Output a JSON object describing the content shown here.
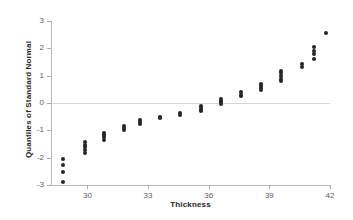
{
  "title": "",
  "chart_data": {
    "type": "scatter",
    "title": "",
    "xlabel": "Thickness",
    "ylabel": "Quantiles of Standard Normal",
    "xlim": [
      28.2,
      42.0
    ],
    "ylim": [
      -3,
      3
    ],
    "xticks": [
      30,
      33,
      36,
      39,
      42
    ],
    "yticks": [
      3,
      2,
      1,
      0,
      -1,
      -2,
      -3
    ],
    "grid": false,
    "legend": null,
    "reference_line": {
      "orientation": "horizontal",
      "y": 0,
      "color": "#d5d5da"
    },
    "marker": {
      "shape": "circle",
      "color": "#262626",
      "size": 4
    },
    "points": [
      {
        "x": 28.8,
        "y": -2.9
      },
      {
        "x": 28.8,
        "y": -2.52
      },
      {
        "x": 28.8,
        "y": -2.27
      },
      {
        "x": 28.8,
        "y": -2.05
      },
      {
        "x": 29.9,
        "y": -1.82
      },
      {
        "x": 29.9,
        "y": -1.72
      },
      {
        "x": 29.9,
        "y": -1.62
      },
      {
        "x": 29.9,
        "y": -1.52
      },
      {
        "x": 29.9,
        "y": -1.42
      },
      {
        "x": 30.8,
        "y": -1.34
      },
      {
        "x": 30.8,
        "y": -1.25
      },
      {
        "x": 30.8,
        "y": -1.16
      },
      {
        "x": 30.8,
        "y": -1.08
      },
      {
        "x": 31.8,
        "y": -1.0
      },
      {
        "x": 31.8,
        "y": -0.92
      },
      {
        "x": 31.8,
        "y": -0.84
      },
      {
        "x": 32.6,
        "y": -0.77
      },
      {
        "x": 32.6,
        "y": -0.7
      },
      {
        "x": 32.6,
        "y": -0.63
      },
      {
        "x": 33.6,
        "y": -0.56
      },
      {
        "x": 33.6,
        "y": -0.5
      },
      {
        "x": 34.6,
        "y": -0.43
      },
      {
        "x": 34.6,
        "y": -0.37
      },
      {
        "x": 35.6,
        "y": -0.3
      },
      {
        "x": 35.6,
        "y": -0.24
      },
      {
        "x": 35.6,
        "y": -0.17
      },
      {
        "x": 35.6,
        "y": -0.11
      },
      {
        "x": 36.6,
        "y": -0.05
      },
      {
        "x": 36.6,
        "y": 0.02
      },
      {
        "x": 36.6,
        "y": 0.09
      },
      {
        "x": 36.6,
        "y": 0.16
      },
      {
        "x": 37.6,
        "y": 0.24
      },
      {
        "x": 37.6,
        "y": 0.31
      },
      {
        "x": 37.6,
        "y": 0.39
      },
      {
        "x": 38.6,
        "y": 0.47
      },
      {
        "x": 38.6,
        "y": 0.55
      },
      {
        "x": 38.6,
        "y": 0.63
      },
      {
        "x": 38.6,
        "y": 0.71
      },
      {
        "x": 39.6,
        "y": 0.8
      },
      {
        "x": 39.6,
        "y": 0.89
      },
      {
        "x": 39.6,
        "y": 0.98
      },
      {
        "x": 39.6,
        "y": 1.08
      },
      {
        "x": 39.6,
        "y": 1.18
      },
      {
        "x": 40.6,
        "y": 1.3
      },
      {
        "x": 40.6,
        "y": 1.42
      },
      {
        "x": 41.2,
        "y": 1.6
      },
      {
        "x": 41.2,
        "y": 1.78
      },
      {
        "x": 41.2,
        "y": 1.92
      },
      {
        "x": 41.2,
        "y": 2.05
      },
      {
        "x": 41.8,
        "y": 2.55
      }
    ]
  }
}
